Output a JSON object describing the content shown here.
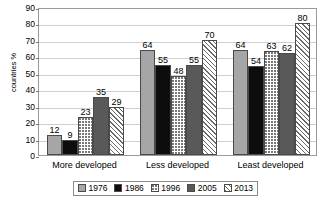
{
  "chart_data": {
    "type": "bar",
    "title": "",
    "subtitle": "",
    "xlabel": "",
    "ylabel": "countries %",
    "ylim": [
      0,
      90
    ],
    "y_ticks": [
      0,
      10,
      20,
      30,
      40,
      50,
      60,
      70,
      80,
      90
    ],
    "grid": true,
    "legend_position": "bottom",
    "categories": [
      "More developed",
      "Less developed",
      "Least developed"
    ],
    "series": [
      {
        "name": "1976",
        "values": [
          12,
          64,
          64
        ],
        "color": "#a6a6a6",
        "pattern": "solid-light-gray"
      },
      {
        "name": "1986",
        "values": [
          9,
          55,
          54
        ],
        "color": "#0d0d0d",
        "pattern": "solid-black"
      },
      {
        "name": "1996",
        "values": [
          23,
          48,
          63
        ],
        "color": "#ffffff",
        "pattern": "dotted"
      },
      {
        "name": "2005",
        "values": [
          35,
          55,
          62
        ],
        "color": "#595959",
        "pattern": "solid-dark-gray"
      },
      {
        "name": "2013",
        "values": [
          29,
          70,
          80
        ],
        "color": "#ffffff",
        "pattern": "diagonal-hatch"
      }
    ],
    "data_labels": [
      [
        12,
        9,
        23,
        35,
        29
      ],
      [
        64,
        55,
        48,
        55,
        70
      ],
      [
        64,
        54,
        63,
        62,
        80
      ]
    ]
  },
  "axes": {
    "y_title": "countries %",
    "y_tick_labels": [
      "90",
      "80",
      "70",
      "60",
      "50",
      "40",
      "30",
      "20",
      "10",
      "0"
    ],
    "x_tick_labels": [
      "More developed",
      "Less developed",
      "Least developed"
    ]
  },
  "legend": {
    "entries": [
      {
        "label": "1976"
      },
      {
        "label": "1986"
      },
      {
        "label": "1996"
      },
      {
        "label": "2005"
      },
      {
        "label": "2013"
      }
    ]
  }
}
